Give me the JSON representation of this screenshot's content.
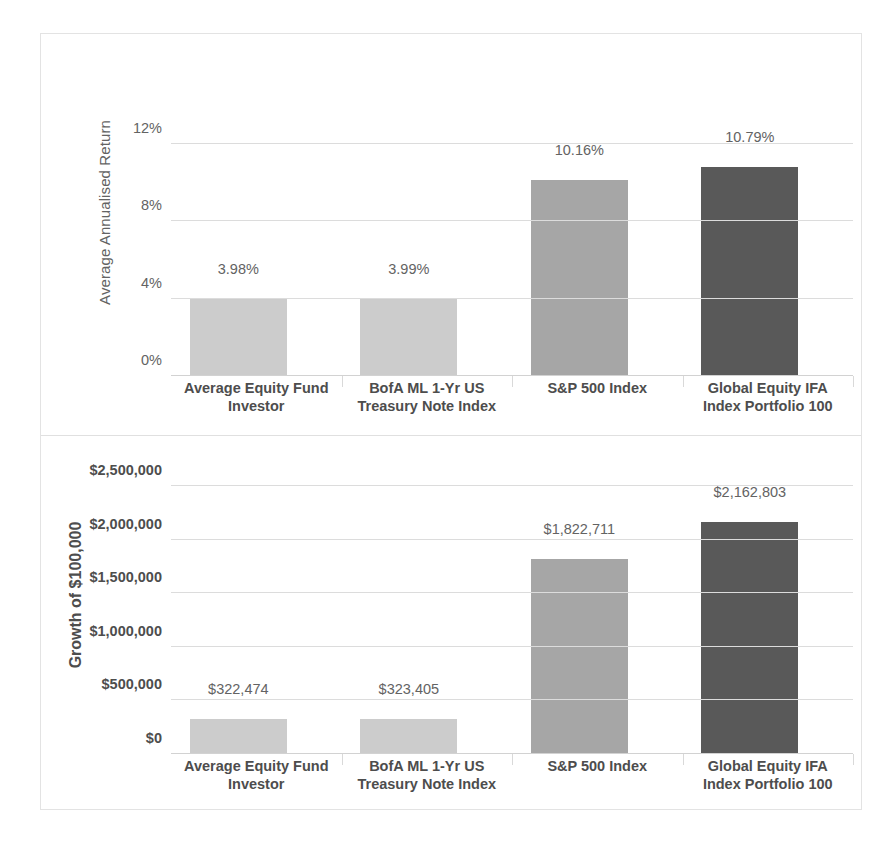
{
  "chart_data": [
    {
      "type": "bar",
      "panel": "top",
      "title": "",
      "xlabel": "",
      "ylabel": "Average Annualised Return",
      "categories": [
        "Average Equity Fund Investor",
        "BofA ML 1-Yr US Treasury Note Index",
        "S&P 500 Index",
        "Global Equity IFA Index Portfolio 100"
      ],
      "category_lines": [
        [
          "Average Equity Fund",
          "Investor"
        ],
        [
          "BofA ML 1-Yr US",
          "Treasury Note Index"
        ],
        [
          "S&P 500 Index",
          ""
        ],
        [
          "Global Equity IFA",
          "Index Portfolio 100"
        ]
      ],
      "values": [
        3.98,
        3.99,
        10.16,
        10.79
      ],
      "value_labels": [
        "3.98%",
        "3.99%",
        "10.16%",
        "10.79%"
      ],
      "ylim": [
        0,
        12
      ],
      "yticks": [
        0,
        4,
        8,
        12
      ],
      "ytick_labels": [
        "0%",
        "4%",
        "8%",
        "12%"
      ],
      "grid": true,
      "legend": "none",
      "bar_colors": [
        "#cccccc",
        "#cccccc",
        "#a6a6a6",
        "#595959"
      ]
    },
    {
      "type": "bar",
      "panel": "bottom",
      "title": "",
      "xlabel": "",
      "ylabel": "Growth of $100,000",
      "categories": [
        "Average Equity Fund Investor",
        "BofA ML 1-Yr US Treasury Note Index",
        "S&P 500 Index",
        "Global Equity IFA Index Portfolio 100"
      ],
      "category_lines": [
        [
          "Average Equity Fund",
          "Investor"
        ],
        [
          "BofA ML 1-Yr US",
          "Treasury Note Index"
        ],
        [
          "S&P 500 Index",
          ""
        ],
        [
          "Global Equity IFA",
          "Index Portfolio 100"
        ]
      ],
      "values": [
        322474,
        323405,
        1822711,
        2162803
      ],
      "value_labels": [
        "$322,474",
        "$323,405",
        "$1,822,711",
        "$2,162,803"
      ],
      "ylim": [
        0,
        2500000
      ],
      "yticks": [
        0,
        500000,
        1000000,
        1500000,
        2000000,
        2500000
      ],
      "ytick_labels": [
        "$0",
        "$500,000",
        "$1,000,000",
        "$1,500,000",
        "$2,000,000",
        "$2,500,000"
      ],
      "grid": true,
      "legend": "none",
      "bar_colors": [
        "#cccccc",
        "#cccccc",
        "#a6a6a6",
        "#595959"
      ]
    }
  ]
}
